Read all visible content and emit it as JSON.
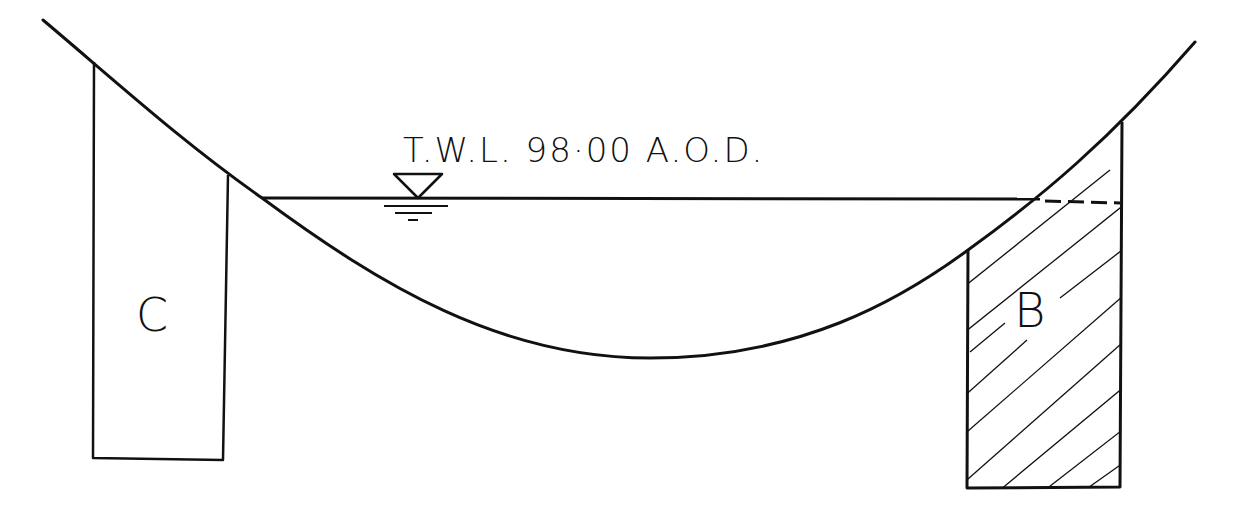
{
  "diagram": {
    "water_level_label": "T.W.L. 98·00 A.O.D.",
    "blocks": [
      {
        "id": "C",
        "label": "C",
        "hatched": false
      },
      {
        "id": "B",
        "label": "B",
        "hatched": true
      }
    ],
    "symbols": {
      "water_level_marker": "water-level-triangle"
    },
    "colors": {
      "ink": "#111111",
      "background": "#ffffff"
    }
  }
}
